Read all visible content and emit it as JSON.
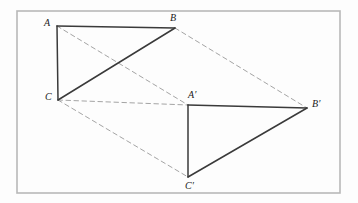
{
  "figure": {
    "canvas": {
      "width": 358,
      "height": 203
    },
    "colors": {
      "background": "#fdfdfd",
      "border": "#b8b8b8",
      "solid_edge": "#3a3a3a",
      "dashed_edge": "#9a9a9a",
      "label_text": "#1a1a1a"
    },
    "border": {
      "x": 17,
      "y": 11,
      "width": 323,
      "height": 182,
      "stroke_width": 1.6
    },
    "vertices": [
      {
        "id": "A",
        "label": "A",
        "x": 57,
        "y": 26,
        "label_x": 44,
        "label_y": 18
      },
      {
        "id": "B",
        "label": "B",
        "x": 175,
        "y": 28,
        "label_x": 170,
        "label_y": 13
      },
      {
        "id": "C",
        "label": "C",
        "x": 58,
        "y": 100,
        "label_x": 45,
        "label_y": 92
      },
      {
        "id": "Ap",
        "label": "A′",
        "x": 188,
        "y": 105,
        "label_x": 188,
        "label_y": 90
      },
      {
        "id": "Bp",
        "label": "B′",
        "x": 307,
        "y": 108,
        "label_x": 312,
        "label_y": 99
      },
      {
        "id": "Cp",
        "label": "C′",
        "x": 188,
        "y": 177,
        "label_x": 185,
        "label_y": 181
      }
    ],
    "edges": [
      {
        "id": "A-B",
        "from": "A",
        "to": "B",
        "style": "solid",
        "name": "edge-a-b"
      },
      {
        "id": "A-C",
        "from": "A",
        "to": "C",
        "style": "solid",
        "name": "edge-a-c"
      },
      {
        "id": "C-B",
        "from": "C",
        "to": "B",
        "style": "solid",
        "name": "edge-c-b"
      },
      {
        "id": "Ap-Bp",
        "from": "Ap",
        "to": "Bp",
        "style": "solid",
        "name": "edge-ap-bp"
      },
      {
        "id": "Ap-Cp",
        "from": "Ap",
        "to": "Cp",
        "style": "solid",
        "name": "edge-ap-cp"
      },
      {
        "id": "Cp-Bp",
        "from": "Cp",
        "to": "Bp",
        "style": "solid",
        "name": "edge-cp-bp"
      },
      {
        "id": "A-Ap",
        "from": "A",
        "to": "Ap",
        "style": "dashed",
        "name": "edge-a-ap"
      },
      {
        "id": "B-Bp",
        "from": "B",
        "to": "Bp",
        "style": "dashed",
        "name": "edge-b-bp"
      },
      {
        "id": "C-Cp",
        "from": "C",
        "to": "Cp",
        "style": "dashed",
        "name": "edge-c-cp"
      },
      {
        "id": "C-Ap",
        "from": "C",
        "to": "Ap",
        "style": "dashed",
        "name": "edge-c-ap"
      }
    ]
  }
}
